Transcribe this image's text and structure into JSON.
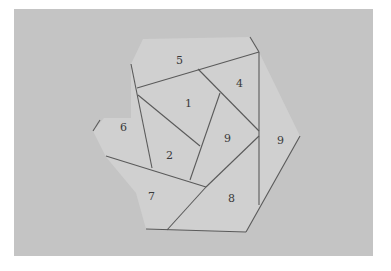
{
  "image": {
    "description": "Grayscale photograph of a hand-drawn hexagonal shape on paper, subdivided by pencil lines into numbered regions",
    "background_color": "#c4c4c4",
    "paper_color": "#d2d2d2",
    "line_color": "#555555"
  },
  "regions": [
    {
      "id": "r5",
      "label": "5",
      "x": 176,
      "y": 60
    },
    {
      "id": "r4",
      "label": "4",
      "x": 238,
      "y": 84
    },
    {
      "id": "r1",
      "label": "1",
      "x": 187,
      "y": 103
    },
    {
      "id": "r6",
      "label": "6",
      "x": 122,
      "y": 127
    },
    {
      "id": "r3",
      "label": "9",
      "x": 226,
      "y": 138
    },
    {
      "id": "r9",
      "label": "9",
      "x": 279,
      "y": 140
    },
    {
      "id": "r2",
      "label": "2",
      "x": 168,
      "y": 155
    },
    {
      "id": "r7",
      "label": "7",
      "x": 150,
      "y": 196
    },
    {
      "id": "r8",
      "label": "8",
      "x": 230,
      "y": 198
    }
  ]
}
